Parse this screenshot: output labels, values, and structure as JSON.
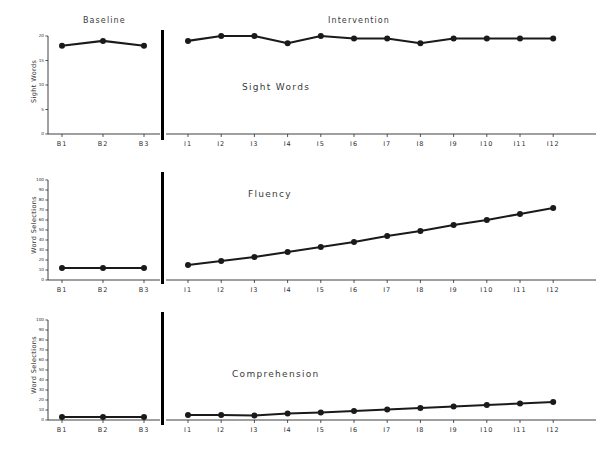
{
  "figure": {
    "phase_labels": [
      {
        "text": "Baseline"
      },
      {
        "text": "Intervention"
      }
    ],
    "divider_label": "phase-change-line"
  },
  "chart_data": [
    {
      "type": "line",
      "title": "Sight Words",
      "xlabel": "",
      "ylabel": "Sight Words",
      "ylim": [
        0,
        20
      ],
      "yticks": [
        0,
        5,
        10,
        15,
        20
      ],
      "grid": false,
      "legend": "none",
      "phases": [
        {
          "name": "Baseline",
          "categories": [
            "B1",
            "B2",
            "B3"
          ],
          "values": [
            18,
            19,
            18
          ]
        },
        {
          "name": "Intervention",
          "categories": [
            "I1",
            "I2",
            "I3",
            "I4",
            "I5",
            "I6",
            "I7",
            "I8",
            "I9",
            "I10",
            "I11",
            "I12"
          ],
          "values": [
            19,
            20,
            20,
            18.5,
            20,
            19.5,
            19.5,
            18.5,
            19.5,
            19.5,
            19.5,
            19.5
          ]
        }
      ]
    },
    {
      "type": "line",
      "title": "Fluency",
      "xlabel": "",
      "ylabel": "Word Selections",
      "ylim": [
        0,
        100
      ],
      "yticks": [
        0,
        10,
        20,
        30,
        40,
        50,
        60,
        70,
        80,
        90,
        100
      ],
      "grid": false,
      "legend": "none",
      "phases": [
        {
          "name": "Baseline",
          "categories": [
            "B1",
            "B2",
            "B3"
          ],
          "values": [
            12,
            12,
            12
          ]
        },
        {
          "name": "Intervention",
          "categories": [
            "I1",
            "I2",
            "I3",
            "I4",
            "I5",
            "I6",
            "I7",
            "I8",
            "I9",
            "I10",
            "I11",
            "I12"
          ],
          "values": [
            15,
            19,
            23,
            28,
            33,
            38,
            44,
            49,
            55,
            60,
            66,
            72
          ]
        }
      ]
    },
    {
      "type": "line",
      "title": "Comprehension",
      "xlabel": "",
      "ylabel": "Word Selections",
      "ylim": [
        0,
        100
      ],
      "yticks": [
        0,
        10,
        20,
        30,
        40,
        50,
        60,
        70,
        80,
        90,
        100
      ],
      "grid": false,
      "legend": "none",
      "phases": [
        {
          "name": "Baseline",
          "categories": [
            "B1",
            "B2",
            "B3"
          ],
          "values": [
            3,
            3,
            3
          ]
        },
        {
          "name": "Intervention",
          "categories": [
            "I1",
            "I2",
            "I3",
            "I4",
            "I5",
            "I6",
            "I7",
            "I8",
            "I9",
            "I10",
            "I11",
            "I12"
          ],
          "values": [
            5,
            5,
            4.5,
            6.5,
            7.5,
            9,
            10.5,
            12,
            13.5,
            15,
            16.5,
            18
          ]
        }
      ]
    }
  ],
  "colors": {
    "line": "#1a1a1a",
    "axis": "#2b2b2b",
    "text": "#2e2e2e",
    "divider": "#000000",
    "background": "#ffffff"
  }
}
